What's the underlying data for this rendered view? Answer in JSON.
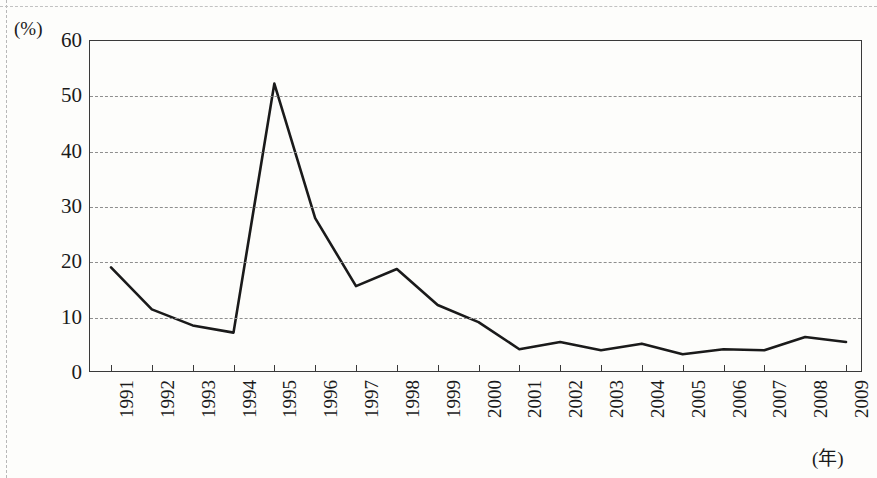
{
  "chart_data": {
    "type": "line",
    "title": "",
    "subtitle": "",
    "xlabel": "(年)",
    "ylabel": "(%)",
    "x": [
      1991,
      1992,
      1993,
      1994,
      1995,
      1996,
      1997,
      1998,
      1999,
      2000,
      2001,
      2002,
      2003,
      2004,
      2005,
      2006,
      2007,
      2008,
      2009
    ],
    "categories": [
      "1991",
      "1992",
      "1993",
      "1994",
      "1995",
      "1996",
      "1997",
      "1998",
      "1999",
      "2000",
      "2001",
      "2002",
      "2003",
      "2004",
      "2005",
      "2006",
      "2007",
      "2008",
      "2009"
    ],
    "values": [
      19.1,
      11.5,
      8.6,
      7.3,
      52.3,
      28.0,
      15.7,
      18.8,
      12.3,
      9.2,
      4.3,
      5.6,
      4.1,
      5.3,
      3.4,
      4.3,
      4.1,
      6.5,
      5.6
    ],
    "ylim": [
      0,
      60
    ],
    "ytick_labels": [
      "60",
      "50",
      "40",
      "30",
      "20",
      "10",
      "0"
    ],
    "yticks": [
      60,
      50,
      40,
      30,
      20,
      10,
      0
    ],
    "gridlines": [
      50,
      40,
      30,
      20,
      10
    ],
    "grid": true,
    "grid_style": "dashed-horizontal",
    "legend": [],
    "legend_position": "none",
    "annotations": [],
    "line_color": "#1a1a1a",
    "line_width": 2.6,
    "markers": false,
    "xtick_rotation": -90
  },
  "axes": {
    "y_unit_label": "(%)",
    "x_unit_label": "(年)"
  },
  "colors": {
    "line": "#1a1a1a",
    "frame": "#3a3a3a",
    "grid": "#8e8e8e",
    "page_background": "#fdfdfb",
    "text": "#1a1a1a"
  }
}
